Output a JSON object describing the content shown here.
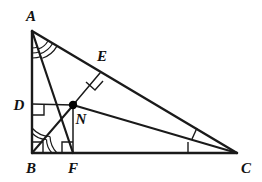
{
  "figure": {
    "kind": "geometry-diagram",
    "stroke_color": "#1a1a1a",
    "background_color": "#ffffff",
    "point_color": "#000000"
  },
  "labels": {
    "A": "A",
    "B": "B",
    "C": "C",
    "D": "D",
    "E": "E",
    "F": "F",
    "N": "N"
  },
  "points": {
    "A": {
      "x": 32,
      "y": 31
    },
    "B": {
      "x": 32,
      "y": 153
    },
    "C": {
      "x": 237,
      "y": 153
    },
    "D": {
      "x": 32,
      "y": 104
    },
    "E": {
      "x": 100,
      "y": 73
    },
    "F": {
      "x": 73,
      "y": 153
    },
    "N": {
      "x": 73,
      "y": 105
    }
  },
  "label_positions": {
    "A": {
      "x": 31,
      "y": 21
    },
    "B": {
      "x": 31,
      "y": 173
    },
    "C": {
      "x": 246,
      "y": 173
    },
    "D": {
      "x": 19,
      "y": 109
    },
    "E": {
      "x": 102,
      "y": 61
    },
    "F": {
      "x": 73,
      "y": 173
    },
    "N": {
      "x": 81,
      "y": 124
    }
  },
  "segments": [
    {
      "name": "side-AB",
      "from": "A",
      "to": "B"
    },
    {
      "name": "side-BC",
      "from": "B",
      "to": "C"
    },
    {
      "name": "side-AC",
      "from": "A",
      "to": "C"
    },
    {
      "name": "bisector-AN-to-F",
      "from": "A",
      "to": "F"
    },
    {
      "name": "bisector-BN-extended",
      "from": "B",
      "to": "N"
    },
    {
      "name": "bisector-CN",
      "from": "C",
      "to": "N"
    },
    {
      "name": "perpendicular-ND",
      "from": "N",
      "to": "D"
    },
    {
      "name": "perpendicular-NE",
      "from": "N",
      "to": "E"
    },
    {
      "name": "perpendicular-NF",
      "from": "N",
      "to": "F"
    }
  ],
  "angle_marks": [
    {
      "name": "right-angle-at-B",
      "vertex": "B",
      "type": "square"
    },
    {
      "name": "right-angle-at-D",
      "vertex": "D",
      "type": "square"
    },
    {
      "name": "right-angle-at-E",
      "vertex": "E",
      "type": "square"
    },
    {
      "name": "right-angle-at-F",
      "vertex": "F",
      "type": "square"
    },
    {
      "name": "angle-bisector-arcs-at-A",
      "vertex": "A",
      "type": "triple-arc",
      "count": 2
    },
    {
      "name": "angle-bisector-arcs-at-B",
      "vertex": "B",
      "type": "double-arc",
      "count": 2
    },
    {
      "name": "angle-bisector-ticks-at-C",
      "vertex": "C",
      "type": "tick",
      "count": 2
    }
  ]
}
